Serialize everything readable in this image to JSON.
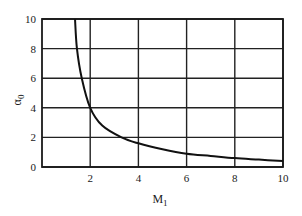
{
  "chart_data": {
    "type": "line",
    "title": "",
    "xlabel": "M",
    "xlabel_subscript": "1",
    "ylabel": "α",
    "ylabel_subscript": "0",
    "xlim": [
      0,
      10
    ],
    "ylim": [
      0,
      10
    ],
    "grid": true,
    "x_ticks": [
      "2",
      "4",
      "6",
      "8",
      "10"
    ],
    "y_ticks": [
      "0",
      "2",
      "4",
      "6",
      "8",
      "10"
    ],
    "series": [
      {
        "name": "alpha0 vs M1",
        "x": [
          1.37,
          1.45,
          1.65,
          2.0,
          2.5,
          3.3,
          4.0,
          5.0,
          6.0,
          7.0,
          8.0,
          9.0,
          10.0
        ],
        "y": [
          10.0,
          8.0,
          6.0,
          4.0,
          2.8,
          2.0,
          1.6,
          1.2,
          0.9,
          0.75,
          0.6,
          0.5,
          0.4
        ]
      }
    ],
    "legend": null
  }
}
